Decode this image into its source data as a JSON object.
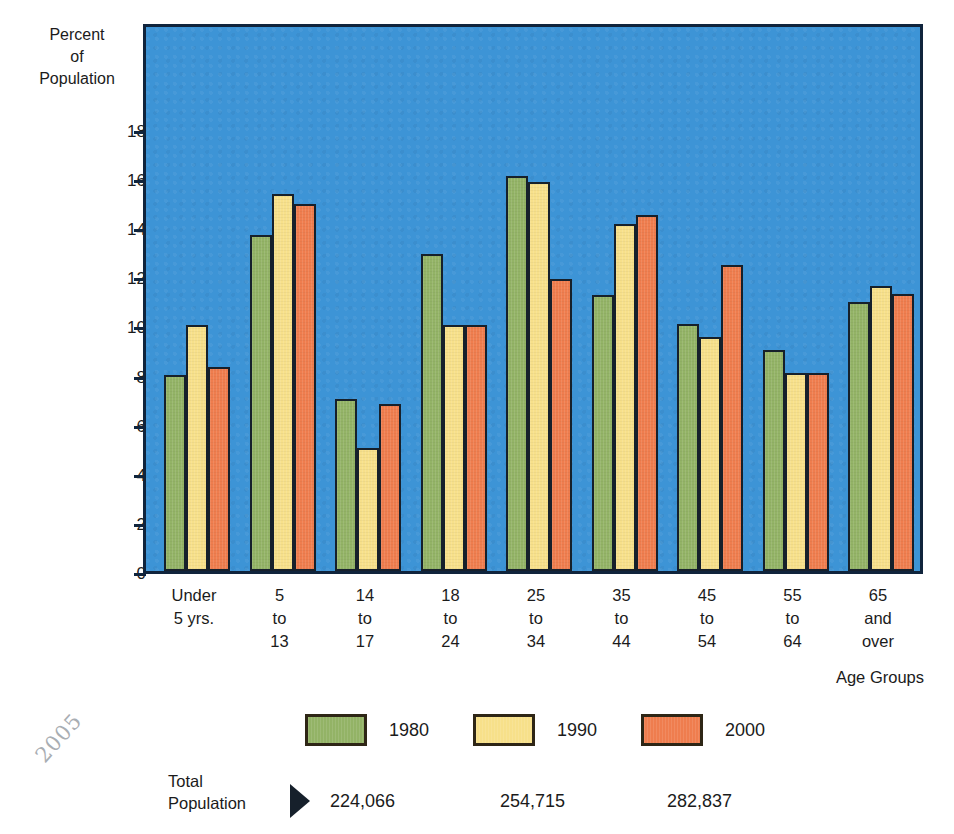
{
  "axes": {
    "y_title": "Percent\nof\nPopulation",
    "x_title": "Age Groups",
    "y_ticks": [
      "18",
      "16",
      "14",
      "12",
      "10",
      "8",
      "6",
      "4",
      "2",
      "0"
    ]
  },
  "legend": {
    "items": [
      {
        "label": "1980",
        "color": "#93b366",
        "swatch_name": "legend-swatch-1980"
      },
      {
        "label": "1990",
        "color": "#f7e08a",
        "swatch_name": "legend-swatch-1990"
      },
      {
        "label": "2000",
        "color": "#ef7d4e",
        "swatch_name": "legend-swatch-2000"
      }
    ]
  },
  "totals": {
    "title": "Total\nPopulation",
    "arrow_icon": "right-triangle-arrow-icon",
    "values": [
      "224,066",
      "254,715",
      "282,837"
    ]
  },
  "margin_mark": "2005",
  "chart_data": {
    "type": "bar",
    "title": "",
    "subtitle": "",
    "xlabel": "Age Groups",
    "ylabel": "Percent of Population",
    "ylim": [
      0,
      19.5
    ],
    "yticks": [
      0,
      2,
      4,
      6,
      8,
      10,
      12,
      14,
      16,
      18
    ],
    "grid": false,
    "legend_position": "bottom",
    "plot_background": "#3d94d6",
    "categories": [
      "Under\n5 yrs.",
      "5\nto\n13",
      "14\nto\n17",
      "18\nto\n24",
      "25\nto\n34",
      "35\nto\n44",
      "45\nto\n54",
      "55\nto\n64",
      "65\nand\nover"
    ],
    "series": [
      {
        "name": "1980",
        "color": "#93b366",
        "total_population": "224,066",
        "values": [
          8.0,
          13.7,
          7.0,
          12.9,
          16.1,
          11.25,
          10.05,
          9.0,
          10.95
        ]
      },
      {
        "name": "1990",
        "color": "#f7e08a",
        "total_population": "254,715",
        "values": [
          10.0,
          15.35,
          5.0,
          10.0,
          15.85,
          14.15,
          9.55,
          8.05,
          11.6
        ]
      },
      {
        "name": "2000",
        "color": "#ef7d4e",
        "total_population": "282,837",
        "values": [
          8.3,
          14.95,
          6.8,
          10.0,
          11.9,
          14.5,
          12.45,
          8.05,
          11.3
        ]
      }
    ]
  }
}
